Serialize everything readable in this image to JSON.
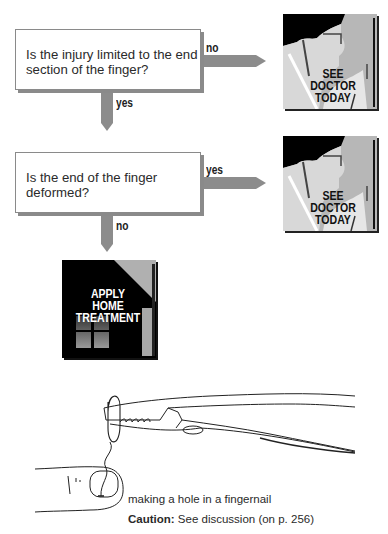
{
  "flowchart": {
    "question1": {
      "line1": "Is the injury limited to the end",
      "line2": "section of the finger?",
      "branch_right_label": "no",
      "branch_down_label": "yes"
    },
    "question2": {
      "line1": "Is the end of the finger",
      "line2": "deformed?",
      "branch_right_label": "yes",
      "branch_down_label": "no"
    },
    "outcome_doctor_1": {
      "line1": "SEE",
      "line2": "DOCTOR",
      "line3": "TODAY"
    },
    "outcome_doctor_2": {
      "line1": "SEE",
      "line2": "DOCTOR",
      "line3": "TODAY"
    },
    "outcome_home": {
      "line1": "APPLY",
      "line2": "HOME",
      "line3": "TREATMENT"
    }
  },
  "illustration": {
    "caption": "making a hole in a fingernail",
    "caution_label": "Caution:",
    "caution_text": " See discussion (on p. 256)"
  },
  "colors": {
    "arrow": "#8c8c8c",
    "box_border": "#8a8a8a",
    "doctor_bg": "#b7b7b7",
    "home_bg": "#000000"
  }
}
